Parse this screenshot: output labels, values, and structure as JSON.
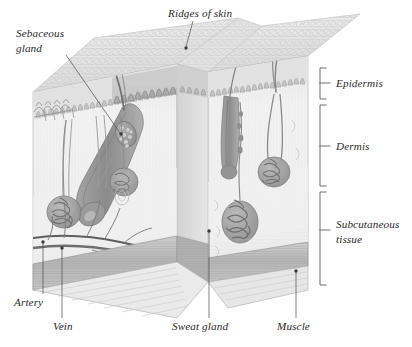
{
  "figure": {
    "style": "grayscale anatomical illustration",
    "background_color": "#ffffff",
    "text_color": "#2b2b2b",
    "leader_line_color": "#4a4a4a"
  },
  "callout_labels": [
    {
      "id": "ridges-of-skin",
      "text": "Ridges of skin",
      "position": "top-center",
      "x": 168,
      "y": 14,
      "anchor": "start",
      "leader": {
        "from_x": 193,
        "from_y": 19,
        "to_x": 185,
        "to_y": 48
      },
      "target": "skin surface ridges"
    },
    {
      "id": "sebaceous-gland",
      "text_line_1": "Sebaceous",
      "text_line_2": "gland",
      "position": "top-left",
      "x": 16,
      "y": 34,
      "anchor": "start",
      "leader": {
        "from_x": 66,
        "from_y": 53,
        "to_x": 121,
        "to_y": 133
      },
      "target": "sebaceous gland cluster"
    },
    {
      "id": "artery",
      "text": "Artery",
      "position": "bottom-left",
      "x": 14,
      "y": 303,
      "anchor": "start",
      "leader": {
        "from_x": 43,
        "from_y": 294,
        "to_x": 43,
        "to_y": 245
      },
      "target": "artery in subcutaneous tissue"
    },
    {
      "id": "vein",
      "text": "Vein",
      "position": "bottom-left",
      "x": 55,
      "y": 327,
      "anchor": "start",
      "leader": {
        "from_x": 62,
        "from_y": 318,
        "to_x": 62,
        "to_y": 251
      },
      "target": "vein in subcutaneous tissue"
    },
    {
      "id": "sweat-gland",
      "text": "Sweat gland",
      "position": "bottom-center",
      "x": 172,
      "y": 327,
      "anchor": "start",
      "leader": {
        "from_x": 209,
        "from_y": 318,
        "to_x": 209,
        "to_y": 232
      },
      "target": "coiled sweat gland"
    },
    {
      "id": "muscle",
      "text": "Muscle",
      "position": "bottom-right",
      "x": 277,
      "y": 327,
      "anchor": "start",
      "leader": {
        "from_x": 296,
        "from_y": 318,
        "to_x": 296,
        "to_y": 273
      },
      "target": "muscle layer"
    }
  ],
  "layer_brackets": [
    {
      "id": "epidermis",
      "text": "Subcutaneous",
      "label": "Epidermis",
      "top_y": 68,
      "bottom_y": 99,
      "bracket_x": 320,
      "tick_y": 83,
      "label_x": 336,
      "label_y": 87
    },
    {
      "id": "dermis",
      "label": "Dermis",
      "top_y": 105,
      "bottom_y": 186,
      "bracket_x": 320,
      "tick_y": 145,
      "label_x": 336,
      "label_y": 149
    },
    {
      "id": "subcutaneous-tissue",
      "label_line_1": "Subcutaneous",
      "label_line_2": "tissue",
      "top_y": 192,
      "bottom_y": 285,
      "bracket_x": 320,
      "tick_y": 233,
      "label_x": 336,
      "label_y": 228
    }
  ],
  "anatomy_features": [
    {
      "name": "hair-shaft-long",
      "description": "long curving hair emerging from right block"
    },
    {
      "name": "hair-shaft-left",
      "description": "hair shaft emerging top-left of center block"
    },
    {
      "name": "hair-follicle-angled",
      "description": "angled hair follicle in left block"
    },
    {
      "name": "hair-follicle-center",
      "description": "hair follicle in center block"
    },
    {
      "name": "hair-follicle-right",
      "description": "hair follicle in right block"
    },
    {
      "name": "sebaceous-gland-cluster",
      "description": "grape-like lobed gland on follicle"
    },
    {
      "name": "sweat-gland-coil-left",
      "description": "coiled sweat gland, left block"
    },
    {
      "name": "sweat-gland-coil-mid",
      "description": "coiled sweat gland, mid block"
    },
    {
      "name": "sweat-gland-coil-center",
      "description": "coiled sweat gland, center block"
    },
    {
      "name": "sweat-gland-coil-right",
      "description": "coiled sweat gland, right block"
    },
    {
      "name": "sweat-duct",
      "description": "spiral duct from gland to surface"
    },
    {
      "name": "dermal-papillae",
      "description": "wavy dermal-epidermal junction"
    },
    {
      "name": "skin-ridge-texture",
      "description": "cobblestone ridge pattern on top surface"
    },
    {
      "name": "artery-vessel",
      "description": "horizontal artery at dermis base"
    },
    {
      "name": "vein-vessel",
      "description": "horizontal vein at dermis base"
    },
    {
      "name": "capillary-network",
      "description": "branching capillaries to glands"
    },
    {
      "name": "muscle-layer",
      "description": "striated muscle at block bottom"
    },
    {
      "name": "subcutaneous-fat",
      "description": "pale fatty tissue layer"
    }
  ],
  "palette": {
    "epidermis_top": "#ececec",
    "epidermis_face": "#dcdcdc",
    "dermis_face": "#eeeeee",
    "dermis_shadow": "#c9c9c9",
    "subcutaneous": "#f1f1f1",
    "muscle": "#bdbdbd",
    "muscle_dark": "#a8a8a8",
    "structure_gray": "#9a9a9a",
    "structure_dark": "#7d7d7d",
    "outline": "#8a8a8a"
  }
}
